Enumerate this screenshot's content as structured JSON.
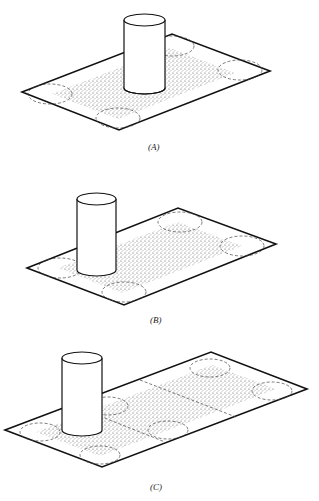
{
  "figures": [
    {
      "id": "A",
      "label": "(A)"
    },
    {
      "id": "B",
      "label": "(B)"
    },
    {
      "id": "C",
      "label": "(C)"
    }
  ],
  "colors": {
    "line": "#111111",
    "stipple": "#333333",
    "background": "#ffffff"
  }
}
